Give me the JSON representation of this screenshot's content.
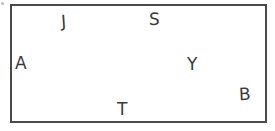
{
  "figure": {
    "canvas": {
      "width": 275,
      "height": 131,
      "background_color": "#ffffff"
    },
    "shape": {
      "type": "rectangle",
      "name": "rectangle-outline",
      "stroke_color": "#4a4a4a",
      "fill_color": "none",
      "stroke_width": 1.6,
      "x": 11,
      "y": 5,
      "width": 255,
      "height": 117
    },
    "label_color": "#3a3a3a",
    "labels": [
      {
        "text": "J",
        "x": 61,
        "y": 13,
        "size": 17,
        "rotate": -4,
        "name": "label-j"
      },
      {
        "text": "S",
        "x": 149,
        "y": 11,
        "size": 17,
        "rotate": 2,
        "name": "label-s"
      },
      {
        "text": "A",
        "x": 15,
        "y": 55,
        "size": 17,
        "rotate": 0,
        "name": "label-a"
      },
      {
        "text": "Y",
        "x": 187,
        "y": 56,
        "size": 17,
        "rotate": 0,
        "name": "label-y"
      },
      {
        "text": "B",
        "x": 239,
        "y": 86,
        "size": 17,
        "rotate": -3,
        "name": "label-b"
      },
      {
        "text": "T",
        "x": 117,
        "y": 101,
        "size": 17,
        "rotate": 0,
        "name": "label-t"
      }
    ],
    "artifact": {
      "name": "scan-speck",
      "x": 1,
      "y": 2,
      "size": 3,
      "color": "#b9b9b9"
    }
  }
}
